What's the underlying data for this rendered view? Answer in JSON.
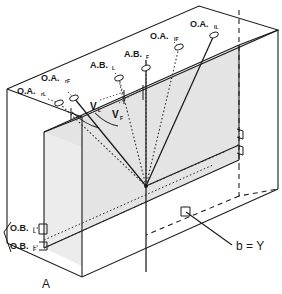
{
  "figure": {
    "kind": "isometric-optical-geometry-diagram",
    "background_color": "#ffffff",
    "line_color": "#1a1a1a",
    "shaded_face_color": "#e2e2e2",
    "shaded_face_color_light": "#ededed",
    "vertex_label_left": "A",
    "baseline_label": "b = Y"
  },
  "labels": {
    "optical_axes": [
      {
        "id": "oa-far-left",
        "text": "O.A.",
        "sub": "rL"
      },
      {
        "id": "oa-left",
        "text": "O.A.",
        "sub": "rF"
      },
      {
        "id": "oa-right",
        "text": "O.A.",
        "sub": "lF"
      },
      {
        "id": "oa-far-right",
        "text": "O.A.",
        "sub": "lL"
      }
    ],
    "axis_bases": [
      {
        "id": "ab-left",
        "text": "A.B.",
        "sub": "L"
      },
      {
        "id": "ab-right",
        "text": "A.B.",
        "sub": "F"
      }
    ],
    "optical_bases": [
      {
        "id": "ob-upper",
        "text": "O.B.",
        "sub": "L"
      },
      {
        "id": "ob-lower",
        "text": "O.B.",
        "sub": "F"
      }
    ],
    "vergence_angles": [
      {
        "id": "v-left",
        "text": "V",
        "sub": "L"
      },
      {
        "id": "v-right",
        "text": "V",
        "sub": "F"
      }
    ],
    "corner": "A",
    "base": "b = Y"
  }
}
